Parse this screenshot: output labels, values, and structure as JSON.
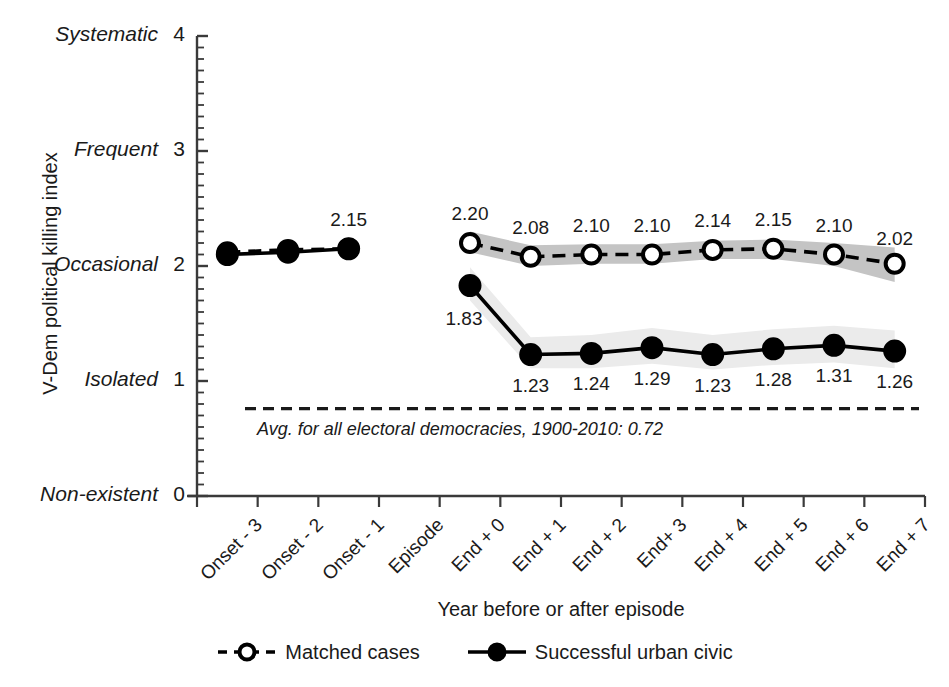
{
  "chart_data": {
    "type": "line",
    "title": "",
    "xlabel": "Year before or after episode",
    "ylabel": "V-Dem political killing index",
    "ylim": [
      0,
      4
    ],
    "grid": false,
    "legend_position": "bottom",
    "categories": [
      "Onset - 3",
      "Onset - 2",
      "Onset - 1",
      "Episode",
      "End + 0",
      "End + 1",
      "End + 2",
      "End+ 3",
      "End + 4",
      "End + 5",
      "End + 6",
      "End + 7"
    ],
    "ytick_values": [
      0,
      1,
      2,
      3,
      4
    ],
    "ytick_labels": [
      {
        "category": "Non-existent",
        "value": "0"
      },
      {
        "category": "Isolated",
        "value": "1"
      },
      {
        "category": "Occasional",
        "value": "2"
      },
      {
        "category": "Frequent",
        "value": "3"
      },
      {
        "category": "Systematic",
        "value": "4"
      }
    ],
    "series": [
      {
        "name": "Matched cases",
        "style": "dashed",
        "marker": "open-circle",
        "color": "#000000",
        "band_color": "#c4c4c4",
        "values": [
          2.12,
          2.14,
          2.15,
          null,
          2.2,
          2.08,
          2.1,
          2.1,
          2.14,
          2.15,
          2.1,
          2.02
        ],
        "labels": [
          "",
          "",
          "2.15",
          "",
          "2.20",
          "2.08",
          "2.10",
          "2.10",
          "2.14",
          "2.15",
          "2.10",
          "2.02"
        ],
        "band_lower": [
          null,
          null,
          null,
          null,
          2.12,
          2.0,
          2.02,
          2.02,
          2.06,
          2.06,
          2.0,
          1.86
        ],
        "band_upper": [
          null,
          null,
          null,
          null,
          2.3,
          2.18,
          2.19,
          2.19,
          2.22,
          2.23,
          2.2,
          2.16
        ]
      },
      {
        "name": "Successful urban civic",
        "style": "solid",
        "marker": "filled-circle",
        "color": "#000000",
        "band_color": "#ebebeb",
        "values": [
          2.1,
          2.12,
          2.15,
          null,
          1.83,
          1.23,
          1.24,
          1.29,
          1.23,
          1.28,
          1.31,
          1.26
        ],
        "labels": [
          "",
          "",
          "",
          "",
          "1.83",
          "1.23",
          "1.24",
          "1.29",
          "1.23",
          "1.28",
          "1.31",
          "1.26"
        ],
        "band_lower": [
          null,
          null,
          null,
          null,
          1.7,
          1.11,
          1.11,
          1.15,
          1.1,
          1.14,
          1.16,
          1.11
        ],
        "band_upper": [
          null,
          null,
          null,
          null,
          1.99,
          1.38,
          1.4,
          1.46,
          1.4,
          1.45,
          1.48,
          1.44
        ]
      }
    ],
    "reference_line": {
      "value": 0.76,
      "style": "dashed",
      "label": "Avg. for all electoral democracies, 1900-2010:  0.72",
      "label_value": "0.72"
    }
  },
  "legend": {
    "entries": [
      {
        "label": "Matched cases",
        "marker": "open-circle",
        "style": "dashed"
      },
      {
        "label": "Successful urban civic",
        "marker": "filled-circle",
        "style": "solid"
      }
    ]
  }
}
